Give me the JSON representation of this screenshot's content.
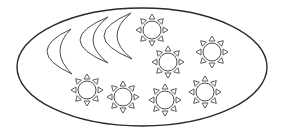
{
  "scene": {
    "description": "Counting illustration: crescent moons and suns inside an oval",
    "counts": {
      "moons": 3,
      "suns": 7
    },
    "colors": {
      "stroke": "#4a4a4a",
      "outline": "#2a2a2a",
      "fill": "#ffffff",
      "background": "#ffffff"
    },
    "oval": {
      "cx": 142,
      "cy": 67,
      "rx": 125,
      "ry": 59
    },
    "moons": [
      {
        "top": [
          71,
          29
        ],
        "bottom": [
          72,
          74
        ],
        "outer_x": 47,
        "inner_x": 60
      },
      {
        "top": [
          108,
          17
        ],
        "bottom": [
          108,
          63
        ],
        "outer_x": 80,
        "inner_x": 93
      },
      {
        "top": [
          131,
          13
        ],
        "bottom": [
          132,
          59
        ],
        "outer_x": 104,
        "inner_x": 117
      }
    ],
    "suns": [
      {
        "cx": 152,
        "cy": 30
      },
      {
        "cx": 168,
        "cy": 62
      },
      {
        "cx": 212,
        "cy": 52
      },
      {
        "cx": 87,
        "cy": 90
      },
      {
        "cx": 123,
        "cy": 97
      },
      {
        "cx": 165,
        "cy": 100
      },
      {
        "cx": 205,
        "cy": 92
      }
    ],
    "sun_style": {
      "radius": 9,
      "ray_count": 8,
      "ray_inner": 11,
      "ray_outer": 16,
      "ray_half_width": 3
    }
  }
}
